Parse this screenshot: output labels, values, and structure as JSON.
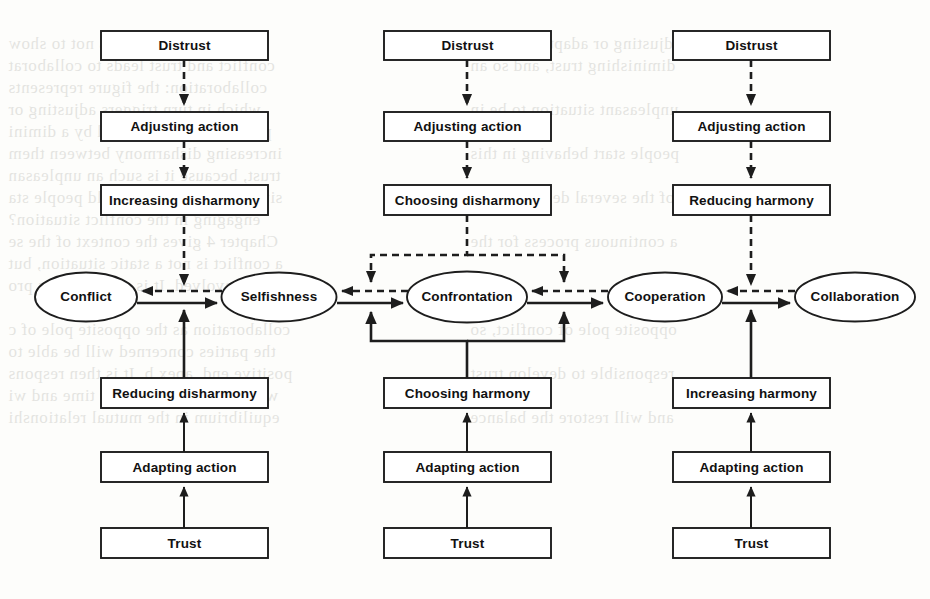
{
  "diagram": {
    "colors": {
      "stroke": "#1d1d1d",
      "background": "#fdfdfb",
      "text": "#111111"
    },
    "columns": [
      {
        "id": "left",
        "top_chain": [
          "Distrust",
          "Adjusting action",
          "Increasing disharmony"
        ],
        "bottom_chain": [
          "Reducing disharmony",
          "Adapting action",
          "Trust"
        ]
      },
      {
        "id": "middle",
        "top_chain": [
          "Distrust",
          "Adjusting action",
          "Choosing disharmony"
        ],
        "bottom_chain": [
          "Choosing harmony",
          "Adapting action",
          "Trust"
        ]
      },
      {
        "id": "right",
        "top_chain": [
          "Distrust",
          "Adjusting action",
          "Reducing harmony"
        ],
        "bottom_chain": [
          "Increasing harmony",
          "Adapting action",
          "Trust"
        ]
      }
    ],
    "boxes": {
      "l_distrust": "Distrust",
      "l_adjusting": "Adjusting action",
      "l_increasing_disharmony": "Increasing disharmony",
      "l_reducing_disharmony": "Reducing disharmony",
      "l_adapting": "Adapting action",
      "l_trust": "Trust",
      "m_distrust": "Distrust",
      "m_adjusting": "Adjusting action",
      "m_choosing_disharmony": "Choosing disharmony",
      "m_choosing_harmony": "Choosing harmony",
      "m_adapting": "Adapting action",
      "m_trust": "Trust",
      "r_distrust": "Distrust",
      "r_adjusting": "Adjusting action",
      "r_reducing_harmony": "Reducing harmony",
      "r_increasing_harmony": "Increasing harmony",
      "r_adapting": "Adapting action",
      "r_trust": "Trust"
    },
    "states": {
      "conflict": "Conflict",
      "selfishness": "Selfishness",
      "confrontation": "Confrontation",
      "cooperation": "Cooperation",
      "collaboration": "Collaboration"
    },
    "legend": {
      "dashed_meaning": "Distrust path (dashed) — moves states leftward toward Conflict",
      "solid_meaning": "Trust path (solid) — moves states rightward toward Collaboration"
    }
  },
  "ghost_text": [
    {
      "x": 8,
      "y": 34,
      "text": "is diagram. The plan is not to show"
    },
    {
      "x": 8,
      "y": 56,
      "text": "conflict and trust leads to collaborat"
    },
    {
      "x": 8,
      "y": 78,
      "text": "collaboration: the figure represents"
    },
    {
      "x": 8,
      "y": 100,
      "text": "which in turn triggers adjusting or"
    },
    {
      "x": 8,
      "y": 122,
      "text": "persons is accompanied by a dimini"
    },
    {
      "x": 8,
      "y": 144,
      "text": "increasing disharmony between them"
    },
    {
      "x": 8,
      "y": 166,
      "text": "trust, because it is such an unpleasan"
    },
    {
      "x": 8,
      "y": 188,
      "text": "situation. Why then would people sta"
    },
    {
      "x": 8,
      "y": 210,
      "text": "engaging in the conflict situation?"
    },
    {
      "x": 8,
      "y": 232,
      "text": "Chapter 4 gives the context of the se"
    },
    {
      "x": 8,
      "y": 254,
      "text": "a conflict is not a static situation, but"
    },
    {
      "x": 8,
      "y": 276,
      "text": "parties involved. It is a continuous pro"
    },
    {
      "x": 8,
      "y": 320,
      "text": "collaboration as the opposite pole of c"
    },
    {
      "x": 8,
      "y": 342,
      "text": "the parties concerned will be able to"
    },
    {
      "x": 8,
      "y": 364,
      "text": "positive end, apex b. It is then respons"
    },
    {
      "x": 8,
      "y": 386,
      "text": "which will develop over time and wi"
    },
    {
      "x": 8,
      "y": 408,
      "text": "equilibrium in the mutual relationshi"
    },
    {
      "x": 470,
      "y": 34,
      "text": "adjusting or adapting action,"
    },
    {
      "x": 470,
      "y": 56,
      "text": "diminishing trust, and so an"
    },
    {
      "x": 470,
      "y": 100,
      "text": "unpleasant situation to be in"
    },
    {
      "x": 470,
      "y": 144,
      "text": "people start behaving in this"
    },
    {
      "x": 470,
      "y": 188,
      "text": "of the several definitions of"
    },
    {
      "x": 470,
      "y": 232,
      "text": "a continuous process for the"
    },
    {
      "x": 470,
      "y": 320,
      "text": "opposite pole of conflict, so"
    },
    {
      "x": 470,
      "y": 364,
      "text": "responsible to develop trust"
    },
    {
      "x": 470,
      "y": 408,
      "text": "and will restore the balance"
    }
  ]
}
